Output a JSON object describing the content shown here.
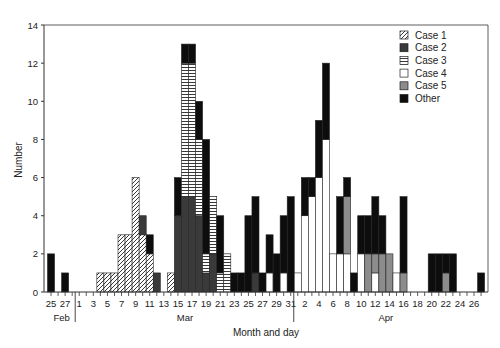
{
  "chart_data": {
    "type": "bar",
    "stacked": true,
    "title": "",
    "xlabel": "Month and day",
    "ylabel": "Number",
    "ylim": [
      0,
      14
    ],
    "yticks": [
      0,
      2,
      4,
      6,
      8,
      10,
      12,
      14
    ],
    "grid": false,
    "legend_position": "upper-right",
    "legend": [
      "Case 1",
      "Case 2",
      "Case 3",
      "Case 4",
      "Case 5",
      "Other"
    ],
    "months": [
      {
        "label": "Feb",
        "start_index": 0,
        "end_index": 3
      },
      {
        "label": "Mar",
        "start_index": 4,
        "end_index": 34
      },
      {
        "label": "Apr",
        "start_index": 35,
        "end_index": 60
      }
    ],
    "x_tick_labels": [
      "25",
      "27",
      "1",
      "3",
      "5",
      "7",
      "9",
      "11",
      "13",
      "15",
      "17",
      "19",
      "21",
      "23",
      "25",
      "27",
      "29",
      "31",
      "2",
      "4",
      "6",
      "8",
      "10",
      "12",
      "14",
      "16",
      "18",
      "20",
      "22",
      "24",
      "26"
    ],
    "categories": [
      "Feb 25",
      "Feb 26",
      "Feb 27",
      "Feb 28",
      "Mar 1",
      "Mar 2",
      "Mar 3",
      "Mar 4",
      "Mar 5",
      "Mar 6",
      "Mar 7",
      "Mar 8",
      "Mar 9",
      "Mar 10",
      "Mar 11",
      "Mar 12",
      "Mar 13",
      "Mar 14",
      "Mar 15",
      "Mar 16",
      "Mar 17",
      "Mar 18",
      "Mar 19",
      "Mar 20",
      "Mar 21",
      "Mar 22",
      "Mar 23",
      "Mar 24",
      "Mar 25",
      "Mar 26",
      "Mar 27",
      "Mar 28",
      "Mar 29",
      "Mar 30",
      "Mar 31",
      "Apr 1",
      "Apr 2",
      "Apr 3",
      "Apr 4",
      "Apr 5",
      "Apr 6",
      "Apr 7",
      "Apr 8",
      "Apr 9",
      "Apr 10",
      "Apr 11",
      "Apr 12",
      "Apr 13",
      "Apr 14",
      "Apr 15",
      "Apr 16",
      "Apr 17",
      "Apr 18",
      "Apr 19",
      "Apr 20",
      "Apr 21",
      "Apr 22",
      "Apr 23",
      "Apr 24",
      "Apr 25",
      "Apr 26",
      "Apr 27"
    ],
    "series": [
      {
        "name": "Case 1",
        "values": [
          0,
          0,
          0,
          0,
          0,
          0,
          0,
          1,
          1,
          1,
          3,
          3,
          6,
          3,
          2,
          0,
          0,
          1,
          0,
          0,
          0,
          0,
          0,
          0,
          0,
          0,
          0,
          0,
          0,
          0,
          0,
          0,
          0,
          0,
          0,
          0,
          0,
          0,
          0,
          0,
          0,
          0,
          0,
          0,
          0,
          0,
          0,
          0,
          0,
          0,
          0,
          0,
          0,
          0,
          0,
          0,
          0,
          0,
          0,
          0,
          0,
          0
        ]
      },
      {
        "name": "Case 2",
        "values": [
          0,
          0,
          0,
          0,
          0,
          0,
          0,
          0,
          0,
          0,
          0,
          0,
          0,
          1,
          0,
          1,
          0,
          0,
          4,
          5,
          5,
          4,
          1,
          2,
          0,
          0,
          0,
          0,
          0,
          1,
          0,
          0,
          0,
          0,
          0,
          0,
          0,
          0,
          0,
          0,
          0,
          0,
          0,
          0,
          0,
          0,
          0,
          0,
          0,
          0,
          0,
          0,
          0,
          0,
          0,
          0,
          0,
          0,
          0,
          0,
          0,
          0
        ]
      },
      {
        "name": "Case 3",
        "values": [
          0,
          0,
          0,
          0,
          0,
          0,
          0,
          0,
          0,
          0,
          0,
          0,
          0,
          0,
          0,
          0,
          0,
          0,
          0,
          7,
          7,
          4,
          1,
          3,
          1,
          2,
          0,
          0,
          0,
          0,
          0,
          0,
          0,
          0,
          0,
          0,
          0,
          0,
          0,
          0,
          0,
          0,
          0,
          0,
          0,
          0,
          0,
          0,
          0,
          0,
          0,
          0,
          0,
          0,
          0,
          0,
          0,
          0,
          0,
          0,
          0,
          0
        ]
      },
      {
        "name": "Case 4",
        "values": [
          0,
          0,
          0,
          0,
          0,
          0,
          0,
          0,
          0,
          0,
          0,
          0,
          0,
          0,
          0,
          0,
          0,
          0,
          0,
          0,
          0,
          0,
          0,
          0,
          0,
          0,
          0,
          0,
          0,
          0,
          0,
          1,
          0,
          1,
          0,
          1,
          4,
          5,
          6,
          8,
          2,
          2,
          2,
          0,
          2,
          0,
          1,
          0,
          0,
          1,
          0,
          0,
          0,
          0,
          0,
          0,
          0,
          0,
          0,
          0,
          0,
          0
        ]
      },
      {
        "name": "Case 5",
        "values": [
          0,
          0,
          0,
          0,
          0,
          0,
          0,
          0,
          0,
          0,
          0,
          0,
          0,
          0,
          0,
          0,
          0,
          0,
          0,
          0,
          0,
          0,
          0,
          0,
          0,
          0,
          0,
          0,
          0,
          0,
          0,
          0,
          0,
          0,
          0,
          0,
          0,
          0,
          0,
          0,
          0,
          0,
          3,
          0,
          0,
          2,
          1,
          2,
          2,
          0,
          1,
          0,
          0,
          0,
          0,
          0,
          1,
          0,
          0,
          0,
          0,
          0
        ]
      },
      {
        "name": "Other",
        "values": [
          2,
          0,
          1,
          0,
          0,
          0,
          0,
          0,
          0,
          0,
          0,
          0,
          0,
          0,
          1,
          0,
          0,
          0,
          2,
          1,
          1,
          2,
          6,
          0,
          3,
          0,
          1,
          1,
          4,
          4,
          1,
          2,
          2,
          3,
          5,
          0,
          2,
          1,
          3,
          4,
          0,
          3,
          1,
          1,
          2,
          2,
          3,
          2,
          0,
          0,
          4,
          0,
          0,
          0,
          2,
          2,
          1,
          2,
          0,
          0,
          0,
          1
        ]
      }
    ]
  },
  "legend": {
    "items": [
      {
        "label": "Case 1",
        "key": "case1"
      },
      {
        "label": "Case 2",
        "key": "case2"
      },
      {
        "label": "Case 3",
        "key": "case3"
      },
      {
        "label": "Case 4",
        "key": "case4"
      },
      {
        "label": "Case 5",
        "key": "case5"
      },
      {
        "label": "Other",
        "key": "other"
      }
    ]
  },
  "axes": {
    "xlabel": "Month and day",
    "ylabel": "Number"
  },
  "colors": {
    "axis": "#333333",
    "case2": "#3a3a3a",
    "case5": "#8c8c8c",
    "other": "#0d0d0d",
    "case4": "#ffffff",
    "stroke": "#222222"
  }
}
